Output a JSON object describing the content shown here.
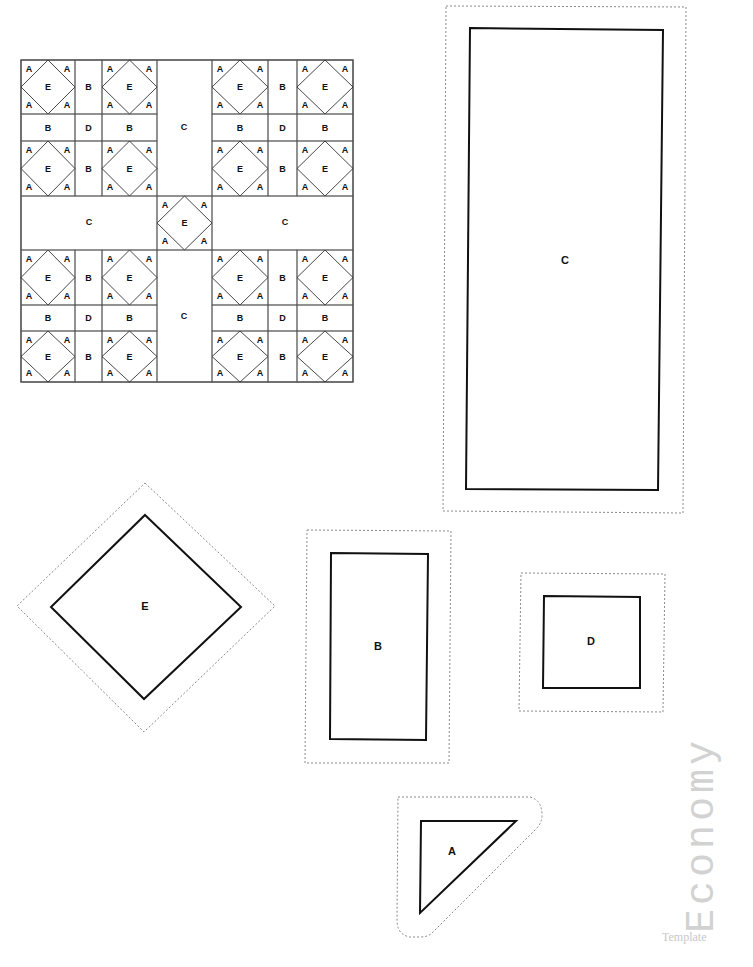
{
  "document": {
    "type": "quilt pattern template sheet",
    "brand": {
      "word": "Economy",
      "subtitle": "Template"
    }
  },
  "quilt_layout": {
    "grid_rows": [
      [
        "E",
        "B",
        "E",
        "C",
        "E",
        "B",
        "E"
      ],
      [
        "B",
        "D",
        "B",
        "C",
        "B",
        "D",
        "B"
      ],
      [
        "E",
        "B",
        "E",
        "C",
        "E",
        "B",
        "E"
      ],
      [
        "C",
        "C",
        "C",
        "E",
        "C",
        "C",
        "C"
      ],
      [
        "E",
        "B",
        "E",
        "C",
        "E",
        "B",
        "E"
      ],
      [
        "B",
        "D",
        "B",
        "C",
        "B",
        "D",
        "B"
      ],
      [
        "E",
        "B",
        "E",
        "C",
        "E",
        "B",
        "E"
      ]
    ],
    "corner_label": "A",
    "labels": {
      "A": "A",
      "B": "B",
      "C": "C",
      "D": "D",
      "E": "E"
    }
  },
  "pieces": [
    {
      "id": "C",
      "label": "C",
      "shape": "rectangle"
    },
    {
      "id": "E",
      "label": "E",
      "shape": "diamond"
    },
    {
      "id": "B",
      "label": "B",
      "shape": "rectangle"
    },
    {
      "id": "D",
      "label": "D",
      "shape": "square"
    },
    {
      "id": "A",
      "label": "A",
      "shape": "triangle"
    }
  ],
  "colors": {
    "line": "#111111",
    "seam": "#8a8a8a",
    "brand": "#d2d2d2"
  }
}
